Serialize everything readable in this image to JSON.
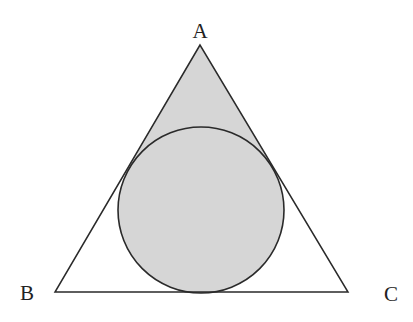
{
  "diagram": {
    "type": "geometry",
    "colors": {
      "stroke": "#2a2a2a",
      "fill": "#d6d6d6",
      "background": "#ffffff"
    },
    "vertices": {
      "A": {
        "label": "A",
        "x": 200,
        "y": 45,
        "label_x": 200,
        "label_y": 38
      },
      "B": {
        "label": "B",
        "x": 55,
        "y": 292,
        "label_x": 27,
        "label_y": 300
      },
      "C": {
        "label": "C",
        "x": 348,
        "y": 292,
        "label_x": 391,
        "label_y": 301
      }
    },
    "circle": {
      "cx": 201,
      "cy": 210,
      "r": 83
    },
    "shaded_region": "circle union triangle(A, left tangent point, right tangent point)"
  }
}
